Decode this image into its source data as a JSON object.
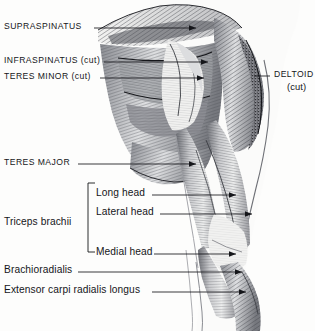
{
  "figure": {
    "view": "posterior",
    "background_color": "#fdfdfc",
    "ink_color": "#15161a"
  },
  "labels": {
    "supraspinatus": "SUPRASPINATUS",
    "infraspinatus": "INFRASPINATUS (cut)",
    "teres_minor": "TERES MINOR (cut)",
    "teres_major": "TERES MAJOR",
    "deltoid": "DELTOID",
    "deltoid_sub": "(cut)",
    "triceps_group": "Triceps brachii",
    "long_head": "Long head",
    "lateral_head": "Lateral head",
    "medial_head": "Medial head",
    "brachioradialis": "Brachioradialis",
    "ecrl": "Extensor carpi radialis longus"
  },
  "structures": [
    {
      "name": "supraspinatus",
      "label": "SUPRASPINATUS",
      "side": "left",
      "cut": false
    },
    {
      "name": "infraspinatus",
      "label": "INFRASPINATUS (cut)",
      "side": "left",
      "cut": true
    },
    {
      "name": "teres-minor",
      "label": "TERES MINOR (cut)",
      "side": "left",
      "cut": true
    },
    {
      "name": "teres-major",
      "label": "TERES MAJOR",
      "side": "left",
      "cut": false
    },
    {
      "name": "deltoid",
      "label": "DELTOID",
      "side": "right",
      "cut": true
    },
    {
      "name": "triceps-long-head",
      "label": "Long head",
      "side": "left",
      "cut": false
    },
    {
      "name": "triceps-lateral-head",
      "label": "Lateral head",
      "side": "left",
      "cut": false
    },
    {
      "name": "triceps-medial-head",
      "label": "Medial head",
      "side": "left",
      "cut": false
    },
    {
      "name": "brachioradialis",
      "label": "Brachioradialis",
      "side": "left",
      "cut": false
    },
    {
      "name": "extensor-carpi-radialis-longus",
      "label": "Extensor carpi radialis longus",
      "side": "left",
      "cut": false
    }
  ]
}
